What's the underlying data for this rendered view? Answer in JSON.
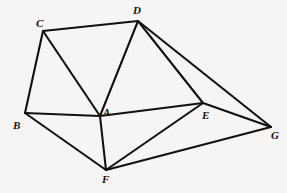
{
  "diagram": {
    "type": "undirected-graph",
    "background_color": "#f6f5f3",
    "line_color": "#121110",
    "line_width": 2.1,
    "canvas": {
      "width": 287,
      "height": 193
    },
    "vertices": [
      {
        "id": "A",
        "label": "A",
        "x": 100,
        "y": 116,
        "label_x": 103,
        "label_y": 107
      },
      {
        "id": "B",
        "label": "B",
        "x": 25,
        "y": 113,
        "label_x": 13,
        "label_y": 120
      },
      {
        "id": "C",
        "label": "C",
        "x": 43,
        "y": 31,
        "label_x": 36,
        "label_y": 18
      },
      {
        "id": "D",
        "label": "D",
        "x": 138,
        "y": 21,
        "label_x": 133,
        "label_y": 5
      },
      {
        "id": "E",
        "label": "E",
        "x": 203,
        "y": 103,
        "label_x": 202,
        "label_y": 110
      },
      {
        "id": "F",
        "label": "F",
        "x": 106,
        "y": 170,
        "label_x": 102,
        "label_y": 174
      },
      {
        "id": "G",
        "label": "G",
        "x": 271,
        "y": 127,
        "label_x": 271,
        "label_y": 130
      }
    ],
    "edges": [
      {
        "id": "CD",
        "from": "C",
        "to": "D"
      },
      {
        "id": "CB",
        "from": "C",
        "to": "B"
      },
      {
        "id": "CA",
        "from": "C",
        "to": "A"
      },
      {
        "id": "DA",
        "from": "D",
        "to": "A"
      },
      {
        "id": "DE",
        "from": "D",
        "to": "E"
      },
      {
        "id": "DG",
        "from": "D",
        "to": "G"
      },
      {
        "id": "BA",
        "from": "B",
        "to": "A"
      },
      {
        "id": "BF",
        "from": "B",
        "to": "F"
      },
      {
        "id": "AE",
        "from": "A",
        "to": "E"
      },
      {
        "id": "AF",
        "from": "A",
        "to": "F"
      },
      {
        "id": "EF",
        "from": "E",
        "to": "F"
      },
      {
        "id": "EG",
        "from": "E",
        "to": "G"
      },
      {
        "id": "FG",
        "from": "F",
        "to": "G"
      }
    ]
  }
}
